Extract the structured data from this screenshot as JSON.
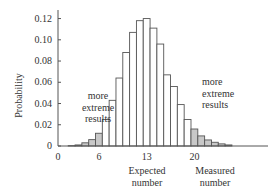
{
  "chart_data": {
    "type": "bar",
    "title": "",
    "xlabel": "Measured number",
    "ylabel": "Probability",
    "x": [
      1,
      2,
      3,
      4,
      5,
      6,
      7,
      8,
      9,
      10,
      11,
      12,
      13,
      14,
      15,
      16,
      17,
      18,
      19,
      20,
      21,
      22,
      23,
      24,
      25
    ],
    "values": [
      0.0,
      0.0003,
      0.001,
      0.003,
      0.006,
      0.012,
      0.025,
      0.043,
      0.064,
      0.088,
      0.107,
      0.118,
      0.12,
      0.111,
      0.096,
      0.067,
      0.056,
      0.039,
      0.025,
      0.016,
      0.0095,
      0.0057,
      0.0035,
      0.002,
      0.001
    ],
    "shaded": [
      false,
      true,
      true,
      true,
      true,
      true,
      false,
      false,
      false,
      false,
      false,
      false,
      false,
      false,
      false,
      false,
      false,
      false,
      false,
      true,
      true,
      true,
      true,
      true,
      true
    ],
    "xlim": [
      0,
      30
    ],
    "ylim": [
      0,
      0.13
    ],
    "x_ticks": [
      {
        "value": 0,
        "label": "0"
      },
      {
        "value": 6,
        "label": "6"
      },
      {
        "value": 13,
        "label": "13"
      },
      {
        "value": 20,
        "label": "20"
      }
    ],
    "y_ticks": [
      {
        "value": 0,
        "label": "0"
      },
      {
        "value": 0.02,
        "label": "0.02"
      },
      {
        "value": 0.04,
        "label": "0.04"
      },
      {
        "value": 0.06,
        "label": "0.06"
      },
      {
        "value": 0.08,
        "label": "0.08"
      },
      {
        "value": 0.1,
        "label": "0.10"
      },
      {
        "value": 0.12,
        "label": "0.12"
      }
    ],
    "annotations": {
      "left_tail": [
        "more",
        "extreme",
        "results"
      ],
      "right_tail": [
        "more",
        "extreme",
        "results"
      ],
      "expected": [
        "Expected",
        "number"
      ],
      "measured": [
        "Measured",
        "number"
      ]
    },
    "grid": false,
    "legend": null,
    "colors": {
      "bar_fill": "#ffffff",
      "bar_shaded": "#c8c8c8",
      "bar_stroke": "#555555",
      "axis": "#555555"
    }
  }
}
